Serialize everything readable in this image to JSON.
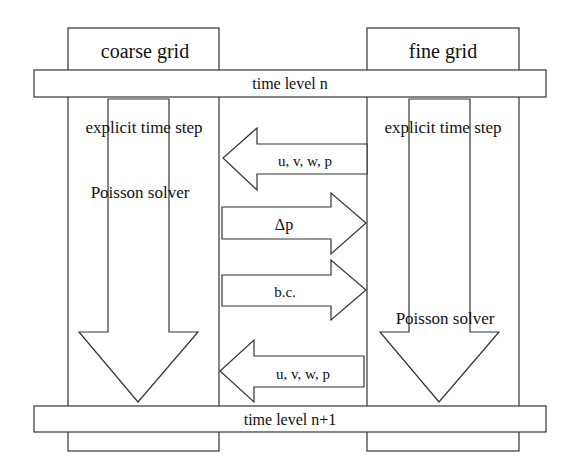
{
  "diagram": {
    "columns": {
      "coarse": {
        "title": "coarse grid",
        "step_label": "explicit time step",
        "solver_label": "Poisson solver"
      },
      "fine": {
        "title": "fine grid",
        "step_label": "explicit time step",
        "solver_label": "Poisson solver"
      }
    },
    "bars": {
      "top": "time level n",
      "bottom": "time level n+1"
    },
    "arrows": [
      {
        "direction": "left",
        "label": "u, v, w, p"
      },
      {
        "direction": "right",
        "label": "Δp"
      },
      {
        "direction": "right",
        "label": "b.c."
      },
      {
        "direction": "left",
        "label": "u, v, w, p"
      }
    ],
    "colors": {
      "stroke": "#333333",
      "fill": "#ffffff",
      "text": "#111111"
    }
  }
}
